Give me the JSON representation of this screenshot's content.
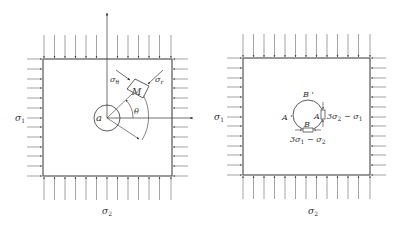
{
  "figure": {
    "left_panel": {
      "name": "stress field around circular hole",
      "labels": {
        "sigma1": "σ",
        "sigma1_sub": "1",
        "sigma2": "σ",
        "sigma2_sub": "2",
        "radius": "a",
        "element": "M",
        "sigma_theta": "σ",
        "sigma_theta_sub": "θ",
        "sigma_r": "σ",
        "sigma_r_sub": "r",
        "angle": "θ"
      }
    },
    "right_panel": {
      "name": "boundary stresses at hole edge points",
      "labels": {
        "sigma1": "σ",
        "sigma1_sub": "1",
        "sigma2": "σ",
        "sigma2_sub": "2",
        "point_A": "A",
        "point_A_prime": "A '",
        "point_B": "B",
        "point_B_prime": "B '",
        "stress_at_A": "3σ",
        "stress_at_A_sub": "2",
        "stress_at_A_rest": " − σ",
        "stress_at_A_rest_sub": "1",
        "stress_at_B": "3σ",
        "stress_at_B_sub": "1",
        "stress_at_B_rest": " − σ",
        "stress_at_B_rest_sub": "2"
      }
    }
  }
}
